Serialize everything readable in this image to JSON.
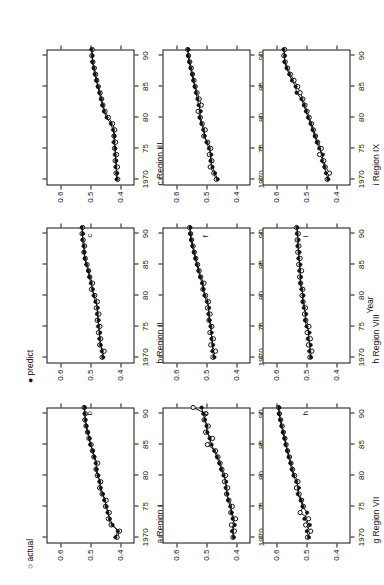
{
  "legend": {
    "items": [
      {
        "symbol": "○",
        "label": "actual"
      },
      {
        "symbol": "●",
        "label": "predict"
      }
    ]
  },
  "axis": {
    "x_title": "Year",
    "x_ticks": [
      "1970",
      "75",
      "80",
      "85",
      "90"
    ],
    "x_tick_values": [
      1970,
      1975,
      1980,
      1985,
      1990
    ],
    "y_ticks": [
      "0.6",
      "0.5",
      "0.4"
    ],
    "y_tick_values": [
      0.6,
      0.5,
      0.4
    ],
    "xlim": [
      1969,
      1991
    ],
    "ylim": [
      0.355,
      0.645
    ]
  },
  "chart_data": {
    "type": "line",
    "title": "",
    "subtitle": "",
    "xlabel": "Year",
    "ylabel": "",
    "xlim": [
      1969,
      1991
    ],
    "ylim": [
      0.355,
      0.645
    ],
    "grid": false,
    "legend_position": "top-left",
    "legend": [
      "actual",
      "predict"
    ],
    "x": [
      1970,
      1971,
      1972,
      1973,
      1974,
      1975,
      1976,
      1977,
      1978,
      1979,
      1980,
      1981,
      1982,
      1983,
      1984,
      1985,
      1986,
      1987,
      1988,
      1989,
      1990,
      1991
    ],
    "panels": [
      {
        "letter": "a",
        "caption": "a Region I",
        "region": "Region I",
        "series": [
          {
            "name": "actual",
            "values": [
              0.412,
              0.404,
              0.432,
              0.441,
              0.438,
              0.451,
              0.448,
              0.462,
              0.47,
              0.466,
              0.478,
              0.482,
              0.476,
              0.489,
              0.494,
              0.498,
              0.505,
              0.51,
              0.515,
              0.519,
              0.517,
              0.521
            ]
          },
          {
            "name": "predict",
            "values": [
              0.418,
              0.41,
              0.427,
              0.436,
              0.444,
              0.447,
              0.455,
              0.459,
              0.466,
              0.471,
              0.474,
              0.48,
              0.483,
              0.487,
              0.492,
              0.501,
              0.503,
              0.508,
              0.513,
              0.516,
              0.52,
              0.519
            ]
          }
        ]
      },
      {
        "letter": "b",
        "caption": "b Region II",
        "region": "Region II",
        "series": [
          {
            "name": "actual",
            "values": [
              0.462,
              0.455,
              0.47,
              0.466,
              0.474,
              0.469,
              0.478,
              0.472,
              0.481,
              0.477,
              0.486,
              0.497,
              0.493,
              0.502,
              0.506,
              0.511,
              0.517,
              0.522,
              0.519,
              0.524,
              0.528,
              0.526
            ]
          },
          {
            "name": "predict",
            "values": [
              0.458,
              0.463,
              0.466,
              0.471,
              0.468,
              0.475,
              0.473,
              0.479,
              0.476,
              0.484,
              0.49,
              0.492,
              0.499,
              0.504,
              0.508,
              0.514,
              0.519,
              0.52,
              0.523,
              0.527,
              0.525,
              0.529
            ]
          }
        ]
      },
      {
        "letter": "c",
        "caption": "c Region III",
        "region": "Region III",
        "series": [
          {
            "name": "actual",
            "values": [
              0.41,
              0.416,
              0.411,
              0.419,
              0.414,
              0.421,
              0.417,
              0.423,
              0.42,
              0.427,
              0.441,
              0.452,
              0.459,
              0.463,
              0.468,
              0.474,
              0.479,
              0.483,
              0.487,
              0.492,
              0.496,
              0.494
            ]
          },
          {
            "name": "predict",
            "values": [
              0.414,
              0.412,
              0.418,
              0.415,
              0.42,
              0.418,
              0.424,
              0.421,
              0.426,
              0.433,
              0.447,
              0.456,
              0.461,
              0.466,
              0.471,
              0.476,
              0.481,
              0.486,
              0.49,
              0.494,
              0.493,
              0.497
            ]
          }
        ]
      },
      {
        "letter": "d",
        "caption": "d Region IV",
        "region": "Region IV",
        "series": [
          {
            "name": "actual",
            "values": [
              0.413,
              0.408,
              0.418,
              0.404,
              0.42,
              0.415,
              0.426,
              0.434,
              0.43,
              0.441,
              0.437,
              0.449,
              0.455,
              0.462,
              0.47,
              0.497,
              0.48,
              0.503,
              0.494,
              0.508,
              0.502,
              0.544
            ]
          },
          {
            "name": "predict",
            "values": [
              0.41,
              0.416,
              0.407,
              0.414,
              0.417,
              0.422,
              0.429,
              0.431,
              0.437,
              0.435,
              0.444,
              0.452,
              0.458,
              0.466,
              0.475,
              0.483,
              0.49,
              0.497,
              0.5,
              0.505,
              0.511,
              0.516
            ]
          }
        ]
      },
      {
        "letter": "e",
        "caption": "e Region V",
        "region": "Region V",
        "series": [
          {
            "name": "actual",
            "values": [
              0.479,
              0.47,
              0.486,
              0.477,
              0.489,
              0.482,
              0.492,
              0.488,
              0.497,
              0.493,
              0.503,
              0.512,
              0.508,
              0.519,
              0.524,
              0.529,
              0.535,
              0.54,
              0.544,
              0.549,
              0.552,
              0.556
            ]
          },
          {
            "name": "predict",
            "values": [
              0.474,
              0.481,
              0.478,
              0.484,
              0.483,
              0.487,
              0.49,
              0.494,
              0.491,
              0.499,
              0.507,
              0.51,
              0.515,
              0.521,
              0.527,
              0.532,
              0.537,
              0.542,
              0.547,
              0.551,
              0.554,
              0.553
            ]
          }
        ]
      },
      {
        "letter": "f",
        "caption": "f Region VI",
        "region": "Region VI",
        "series": [
          {
            "name": "actual",
            "values": [
              0.468,
              0.476,
              0.488,
              0.482,
              0.491,
              0.486,
              0.496,
              0.509,
              0.504,
              0.514,
              0.52,
              0.528,
              0.517,
              0.524,
              0.531,
              0.537,
              0.541,
              0.546,
              0.55,
              0.555,
              0.559,
              0.562
            ]
          },
          {
            "name": "predict",
            "values": [
              0.463,
              0.472,
              0.48,
              0.487,
              0.484,
              0.492,
              0.5,
              0.506,
              0.511,
              0.517,
              0.523,
              0.519,
              0.526,
              0.53,
              0.535,
              0.539,
              0.544,
              0.548,
              0.553,
              0.557,
              0.561,
              0.56
            ]
          }
        ]
      },
      {
        "letter": "g",
        "caption": "g Region VII",
        "region": "Region VII",
        "series": [
          {
            "name": "actual",
            "values": [
              0.497,
              0.486,
              0.503,
              0.493,
              0.521,
              0.51,
              0.516,
              0.524,
              0.533,
              0.528,
              0.539,
              0.546,
              0.551,
              0.556,
              0.562,
              0.567,
              0.571,
              0.576,
              0.58,
              0.585,
              0.589,
              0.592
            ]
          },
          {
            "name": "predict",
            "values": [
              0.492,
              0.499,
              0.489,
              0.507,
              0.498,
              0.513,
              0.519,
              0.529,
              0.525,
              0.534,
              0.543,
              0.549,
              0.553,
              0.559,
              0.564,
              0.569,
              0.573,
              0.578,
              0.583,
              0.587,
              0.591,
              0.59
            ]
          }
        ]
      },
      {
        "letter": "h",
        "caption": "h Region VIII",
        "region": "Region VIII",
        "series": [
          {
            "name": "actual",
            "values": [
              0.489,
              0.482,
              0.494,
              0.487,
              0.498,
              0.492,
              0.502,
              0.507,
              0.503,
              0.511,
              0.515,
              0.512,
              0.519,
              0.523,
              0.516,
              0.526,
              0.521,
              0.529,
              0.525,
              0.531,
              0.527,
              0.533
            ]
          },
          {
            "name": "predict",
            "values": [
              0.485,
              0.491,
              0.486,
              0.496,
              0.49,
              0.5,
              0.505,
              0.501,
              0.509,
              0.513,
              0.51,
              0.517,
              0.521,
              0.518,
              0.524,
              0.52,
              0.527,
              0.523,
              0.53,
              0.526,
              0.532,
              0.53
            ]
          }
        ]
      },
      {
        "letter": "i",
        "caption": "i Region IX",
        "region": "Region IX",
        "series": [
          {
            "name": "actual",
            "values": [
              0.432,
              0.424,
              0.438,
              0.443,
              0.457,
              0.451,
              0.463,
              0.47,
              0.477,
              0.483,
              0.491,
              0.498,
              0.505,
              0.512,
              0.521,
              0.529,
              0.541,
              0.553,
              0.562,
              0.57,
              0.575,
              0.572
            ]
          },
          {
            "name": "predict",
            "values": [
              0.428,
              0.436,
              0.441,
              0.449,
              0.446,
              0.458,
              0.466,
              0.473,
              0.48,
              0.487,
              0.495,
              0.502,
              0.509,
              0.517,
              0.533,
              0.536,
              0.548,
              0.557,
              0.566,
              0.573,
              0.571,
              0.576
            ]
          }
        ]
      }
    ]
  }
}
